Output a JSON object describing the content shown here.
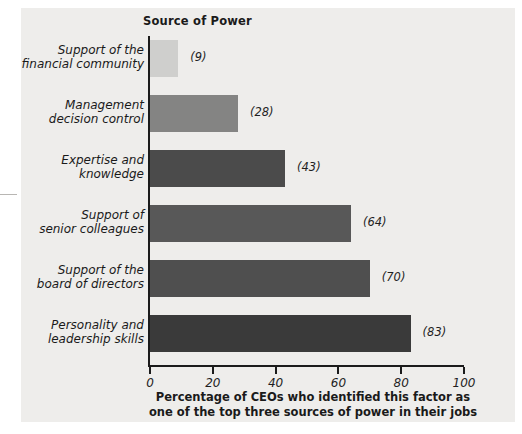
{
  "chart_data": {
    "type": "bar",
    "orientation": "horizontal",
    "title": "Source of Power",
    "xlabel_line1": "Percentage of CEOs who identified this factor as",
    "xlabel_line2": "one of the top three sources of power in their jobs",
    "ylabel": "",
    "xlim": [
      0,
      100
    ],
    "xticks": [
      "0",
      "20",
      "40",
      "60",
      "80",
      "100"
    ],
    "xtick_values": [
      0,
      20,
      40,
      60,
      80,
      100
    ],
    "grid": false,
    "legend": "none",
    "categories": [
      "Support of the\nfinancial community",
      "Management\ndecision control",
      "Expertise and\nknowledge",
      "Support of\nsenior colleagues",
      "Support of the\nboard of directors",
      "Personality and\nleadership skills"
    ],
    "values": [
      9,
      28,
      43,
      64,
      70,
      83
    ],
    "value_labels": [
      "(9)",
      "(28)",
      "(43)",
      "(64)",
      "(70)",
      "(83)"
    ],
    "bars": [
      {
        "label_line1": "Support of the",
        "label_line2": "financial community",
        "value": 9,
        "value_label": "(9)",
        "color": "#cfcfcd"
      },
      {
        "label_line1": "Management",
        "label_line2": "decision control",
        "value": 28,
        "value_label": "(28)",
        "color": "#848483"
      },
      {
        "label_line1": "Expertise and",
        "label_line2": "knowledge",
        "value": 43,
        "value_label": "(43)",
        "color": "#4b4b4b"
      },
      {
        "label_line1": "Support of",
        "label_line2": "senior colleagues",
        "value": 64,
        "value_label": "(64)",
        "color": "#585858"
      },
      {
        "label_line1": "Support of the",
        "label_line2": "board of directors",
        "value": 70,
        "value_label": "(70)",
        "color": "#4f4f4f"
      },
      {
        "label_line1": "Personality and",
        "label_line2": "leadership skills",
        "value": 83,
        "value_label": "(83)",
        "color": "#3a3a3a"
      }
    ],
    "axis_color": "#1b1b1b",
    "background_color": "#eeedeb"
  }
}
